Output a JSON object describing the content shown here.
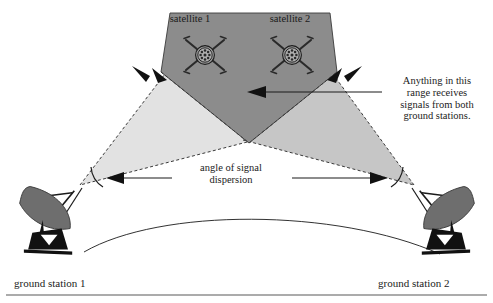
{
  "diagram": {
    "labels": {
      "satellite_1": "satellite 1",
      "satellite_2": "satellite 2",
      "ground_station_1": "ground station 1",
      "ground_station_2": "ground station 2",
      "range_note": "Anything in this\nrange receives\nsignals from both\nground stations.",
      "angle_note": "angle of signal\ndispersion"
    },
    "colors": {
      "overlap_fill": "#8c8c8c",
      "left_beam_fill": "#e2e2e2",
      "right_beam_fill": "#c6c6c6",
      "stroke": "#1b1b1b",
      "dish_body": "#6e6e6e",
      "dish_base": "#111111",
      "background": "#ffffff",
      "rule": "#8f8f8f"
    },
    "elements": {
      "satellite_count": 2,
      "ground_station_count": 2,
      "beam_count": 2,
      "overlap_regions": 1,
      "leader_lines": 3,
      "angle_arcs": 2
    }
  }
}
